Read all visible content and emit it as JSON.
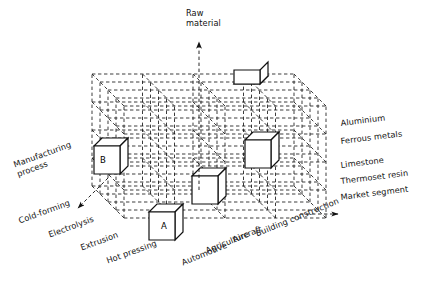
{
  "figure": {
    "type": "morphological-box",
    "line_color": "#1a1a1a",
    "cell_fill": "#ffffff",
    "background": "#ffffff"
  },
  "axes": {
    "vertical": {
      "title": "Raw\nmaterial",
      "title_line1": "Raw",
      "title_line2": "material",
      "arrow": "up",
      "name": "raw-material-axis"
    },
    "right": {
      "title": "Market segment",
      "arrow": "right",
      "name": "market-segment-axis"
    },
    "left": {
      "title_line1": "Manufacturing",
      "title_line2": "process",
      "title": "Manufacturing process",
      "arrow": "down-left",
      "name": "manufacturing-process-axis"
    }
  },
  "raw_materials": [
    "Aluminium",
    "Ferrous metals",
    "Limestone",
    "Thermoset resin"
  ],
  "market_segments": [
    "Automotive",
    "Agriculture",
    "Aircraft",
    "Building construction"
  ],
  "manufacturing_processes": [
    "Cold-forming",
    "Electrolysis",
    "Extrusion",
    "Hot pressing"
  ],
  "highlighted_cells": [
    {
      "id": "cube-top",
      "label": "",
      "position": "top surface, right of centre"
    },
    {
      "id": "cube-b",
      "label": "B",
      "position": "left face, upper-middle level"
    },
    {
      "id": "cube-right",
      "label": "",
      "position": "right front, middle level"
    },
    {
      "id": "cube-centre",
      "label": "",
      "position": "front, lower-middle level"
    },
    {
      "id": "cube-a",
      "label": "A",
      "position": "front bottom, left of centre"
    }
  ],
  "grid": {
    "columns": 4,
    "rows": 4,
    "layers": 4
  }
}
